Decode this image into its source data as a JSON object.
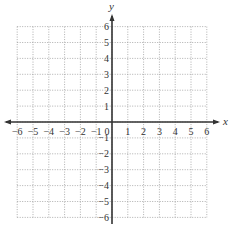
{
  "chart_data": {
    "type": "scatter",
    "title": "",
    "xlabel": "x",
    "ylabel": "y",
    "xlim": [
      -6,
      6
    ],
    "ylim": [
      -6,
      6
    ],
    "grid": true,
    "grid_style": "dotted",
    "x_ticks": [
      "-6",
      "-5",
      "-4",
      "-3",
      "-2",
      "-1",
      "0",
      "1",
      "2",
      "3",
      "4",
      "5",
      "6"
    ],
    "y_ticks": [
      "6",
      "5",
      "4",
      "3",
      "2",
      "1",
      "-1",
      "-2",
      "-3",
      "-4",
      "-5",
      "-6"
    ],
    "series": []
  },
  "labels": {
    "x_axis": "x",
    "y_axis": "y",
    "origin": "0"
  },
  "colors": {
    "axis": "#333333",
    "grid": "#9a9a9a",
    "text": "#333333"
  }
}
